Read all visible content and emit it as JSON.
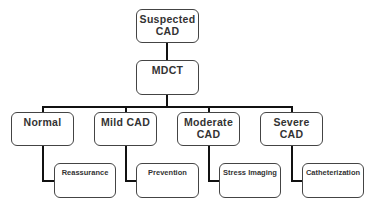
{
  "diagram": {
    "type": "flowchart",
    "root": {
      "label_line1": "Suspected",
      "label_line2": "CAD"
    },
    "second": {
      "label": "MDCT"
    },
    "categories": [
      {
        "label": "Normal",
        "action": "Reassurance"
      },
      {
        "label": "Mild CAD",
        "action": "Prevention"
      },
      {
        "label_line1": "Moderate",
        "label_line2": "CAD",
        "action": "Stress Imaging"
      },
      {
        "label": "Severe CAD",
        "action": "Catheterization"
      }
    ]
  }
}
